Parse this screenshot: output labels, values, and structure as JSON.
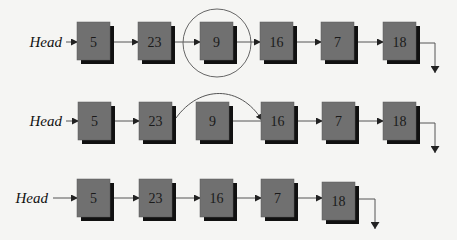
{
  "diagram": {
    "colors": {
      "background": "#f5f5f3",
      "node_fill": "#707070",
      "node_shadow": "#111111",
      "link": "#555555"
    },
    "rows": [
      {
        "name": "original-list",
        "head_label": "Head",
        "nodes": [
          "5",
          "23",
          "9",
          "16",
          "7",
          "18"
        ],
        "highlighted_node": "9",
        "annotation": "circle around node 9"
      },
      {
        "name": "bypass-list",
        "head_label": "Head",
        "nodes": [
          "5",
          "23",
          "9",
          "16",
          "7",
          "18"
        ],
        "annotation": "curved pointer from 23 to 16 bypassing 9"
      },
      {
        "name": "result-list",
        "head_label": "Head",
        "nodes": [
          "5",
          "23",
          "16",
          "7",
          "18"
        ],
        "annotation": "node 9 removed"
      }
    ],
    "null_terminator": "ground-arrow-icon"
  }
}
